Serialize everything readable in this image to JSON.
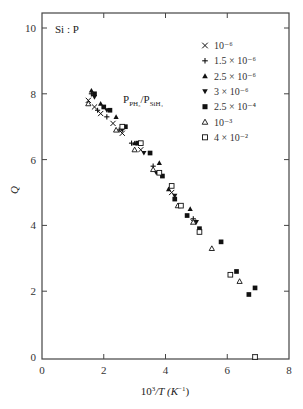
{
  "chart_data": {
    "type": "scatter",
    "title": "",
    "annotation_top_left": "Si : P",
    "annotation_ratio": "P_PH3/P_SiH4",
    "xlabel": "10^3/T (K^-1)",
    "ylabel": "Q",
    "xlim": [
      0,
      8
    ],
    "ylim": [
      0,
      10.5
    ],
    "xticks": [
      0,
      2,
      4,
      6,
      8
    ],
    "yticks": [
      0,
      2,
      4,
      6,
      8,
      10
    ],
    "grid": false,
    "legend_position": "upper right",
    "series": [
      {
        "name": "10^-6",
        "label": "10⁻⁶",
        "marker": "x",
        "points": [
          [
            1.5,
            7.8
          ],
          [
            1.7,
            7.6
          ],
          [
            1.9,
            7.4
          ],
          [
            2.3,
            7.1
          ],
          [
            2.6,
            6.8
          ],
          [
            3.2,
            6.3
          ],
          [
            4.2,
            5.0
          ],
          [
            4.9,
            4.1
          ],
          [
            6.9,
            0.0
          ]
        ]
      },
      {
        "name": "1.5x10^-6",
        "label": "1.5 × 10⁻⁶",
        "marker": "+",
        "points": [
          [
            1.6,
            8.0
          ],
          [
            1.8,
            7.5
          ],
          [
            2.1,
            7.3
          ],
          [
            2.5,
            6.9
          ],
          [
            2.9,
            6.5
          ],
          [
            3.6,
            5.8
          ],
          [
            4.9,
            4.2
          ]
        ]
      },
      {
        "name": "2.5x10^-6",
        "label": "2.5 × 10⁻⁶",
        "marker": "triangle-up-filled",
        "points": [
          [
            1.6,
            8.1
          ],
          [
            1.9,
            7.7
          ],
          [
            2.4,
            7.3
          ],
          [
            3.0,
            6.5
          ],
          [
            3.8,
            5.9
          ],
          [
            4.1,
            5.1
          ],
          [
            4.8,
            4.5
          ]
        ]
      },
      {
        "name": "3x10^-6",
        "label": "3 × 10⁻⁶",
        "marker": "triangle-down-filled",
        "points": [
          [
            1.7,
            7.9
          ],
          [
            2.1,
            7.5
          ],
          [
            2.6,
            6.9
          ],
          [
            3.3,
            6.2
          ],
          [
            3.7,
            5.6
          ],
          [
            4.3,
            4.9
          ],
          [
            5.0,
            4.1
          ]
        ]
      },
      {
        "name": "2.5x10^-4",
        "label": "2.5 × 10⁻⁴",
        "marker": "square-filled",
        "points": [
          [
            1.7,
            8.0
          ],
          [
            2.0,
            7.6
          ],
          [
            2.2,
            7.5
          ],
          [
            2.7,
            7.0
          ],
          [
            3.1,
            6.5
          ],
          [
            3.5,
            6.2
          ],
          [
            3.9,
            5.5
          ],
          [
            4.3,
            4.8
          ],
          [
            4.7,
            4.3
          ],
          [
            5.1,
            3.9
          ],
          [
            5.8,
            3.5
          ],
          [
            6.3,
            2.6
          ],
          [
            6.7,
            1.9
          ],
          [
            6.9,
            2.1
          ]
        ]
      },
      {
        "name": "10^-3",
        "label": "10⁻³",
        "marker": "triangle-up-open",
        "points": [
          [
            1.5,
            7.7
          ],
          [
            2.4,
            6.9
          ],
          [
            3.0,
            6.3
          ],
          [
            3.6,
            5.7
          ],
          [
            4.4,
            4.6
          ],
          [
            4.9,
            4.1
          ],
          [
            5.5,
            3.3
          ],
          [
            6.4,
            2.3
          ]
        ]
      },
      {
        "name": "4x10^-2",
        "label": "4 × 10⁻²",
        "marker": "square-open",
        "points": [
          [
            2.6,
            7.0
          ],
          [
            3.2,
            6.5
          ],
          [
            3.8,
            5.6
          ],
          [
            4.2,
            5.2
          ],
          [
            4.5,
            4.6
          ],
          [
            5.1,
            3.8
          ],
          [
            6.1,
            2.5
          ],
          [
            6.9,
            0.0
          ]
        ]
      }
    ]
  },
  "axes": {
    "x_tick_labels": [
      "0",
      "2",
      "4",
      "6",
      "8"
    ],
    "y_tick_labels": [
      "0",
      "2",
      "4",
      "6",
      "8",
      "10"
    ],
    "ylabel": "Q",
    "xlabel_prefix": "10",
    "xlabel_sup": "3",
    "xlabel_mid": "/T (K",
    "xlabel_sup2": "−1",
    "xlabel_end": ")"
  },
  "annotations": {
    "material": "Si : P",
    "ratio_p": "P",
    "ratio_sub1": "PH₃",
    "ratio_slash": "/P",
    "ratio_sub2": "SiH₄"
  }
}
